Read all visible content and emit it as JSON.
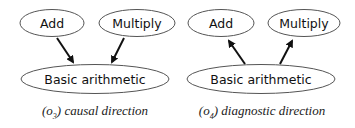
{
  "panels": [
    {
      "id": "o3",
      "caption": {
        "prefix": "(o",
        "subscript": "3",
        "suffix": ") causal direction"
      },
      "nodes": {
        "add": "Add",
        "multiply": "Multiply",
        "basic": "Basic arithmetic"
      },
      "edges": [
        {
          "from": "Add",
          "to": "Basic arithmetic"
        },
        {
          "from": "Multiply",
          "to": "Basic arithmetic"
        }
      ]
    },
    {
      "id": "o4",
      "caption": {
        "prefix": "(o",
        "subscript": "4",
        "suffix": ") diagnostic direction"
      },
      "nodes": {
        "add": "Add",
        "multiply": "Multiply",
        "basic": "Basic arithmetic"
      },
      "edges": [
        {
          "from": "Basic arithmetic",
          "to": "Add"
        },
        {
          "from": "Basic arithmetic",
          "to": "Multiply"
        }
      ]
    }
  ]
}
